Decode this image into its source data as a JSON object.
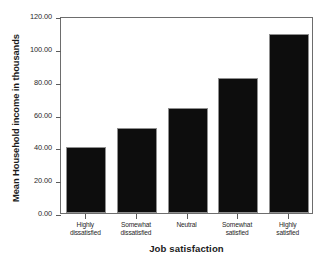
{
  "chart_data": {
    "type": "bar",
    "title": "",
    "categories": [
      "Highly\ndissatisfied",
      "Somewhat\ndissatisfied",
      "Neutral",
      "Somewhat\nsatisfied",
      "Highly\nsatisfied"
    ],
    "values": [
      40,
      52,
      64,
      82,
      109
    ],
    "xlabel": "Job satisfaction",
    "ylabel": "Mean Household income in thousands",
    "ylim": [
      0,
      120
    ],
    "ytick_values": [
      0,
      20,
      40,
      60,
      80,
      100,
      120
    ],
    "ytick_labels": [
      "0.00",
      "20.00",
      "40.00",
      "60.00",
      "80.00",
      "100.00",
      "120.00"
    ],
    "grid": false,
    "legend": false,
    "bar_color": "#0d0d0d",
    "bar_edge_color": "#8f8f8f",
    "frame_color": "#6d6d6d",
    "background_color": "#ffffff"
  }
}
